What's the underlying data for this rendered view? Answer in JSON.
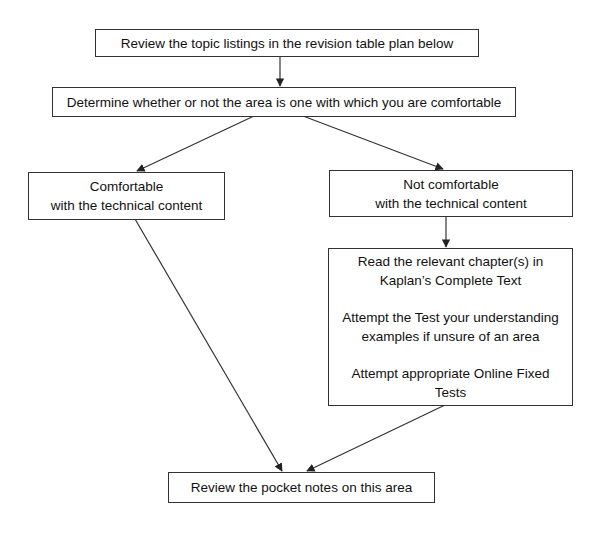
{
  "diagram": {
    "type": "flowchart",
    "nodes": {
      "review_listings": {
        "text": "Review the topic listings in the revision table plan below"
      },
      "determine": {
        "text": "Determine whether or not the area is one with which you are comfortable"
      },
      "comfortable": {
        "line1": "Comfortable",
        "line2": "with the technical content"
      },
      "not_comfortable": {
        "line1": "Not comfortable",
        "line2": "with the technical content"
      },
      "actions": {
        "p1_line1": "Read the relevant chapter(s) in",
        "p1_line2": "Kaplan’s Complete Text",
        "p2_line1": "Attempt the Test your understanding",
        "p2_line2": "examples if unsure of an area",
        "p3_line1": "Attempt appropriate Online Fixed",
        "p3_line2": "Tests"
      },
      "pocket_notes": {
        "text": "Review the pocket notes on this area"
      }
    },
    "edges": [
      [
        "review_listings",
        "determine"
      ],
      [
        "determine",
        "comfortable"
      ],
      [
        "determine",
        "not_comfortable"
      ],
      [
        "not_comfortable",
        "actions"
      ],
      [
        "comfortable",
        "pocket_notes"
      ],
      [
        "actions",
        "pocket_notes"
      ]
    ],
    "line_color": "#333333"
  }
}
